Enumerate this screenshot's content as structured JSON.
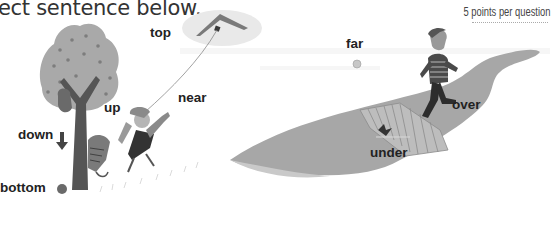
{
  "header": {
    "instruction_fragment": "ect sentence below.",
    "points_note": "5 points per question"
  },
  "scene": {
    "labels": {
      "top": "top",
      "near": "near",
      "up": "up",
      "down": "down",
      "bottom": "bottom",
      "far": "far",
      "over": "over",
      "under": "under"
    },
    "illustrations": [
      "tree",
      "kite",
      "girl-with-bat",
      "cat-climbing-tree",
      "bird-in-tree",
      "ball",
      "boy-crossing-bridge",
      "river",
      "bridge",
      "fish-under-bridge"
    ],
    "colors": {
      "text": "#222222",
      "grey_light": "#b5b5b5",
      "grey_mid": "#8e8e8e",
      "grey_dark": "#4a4a4a"
    }
  }
}
